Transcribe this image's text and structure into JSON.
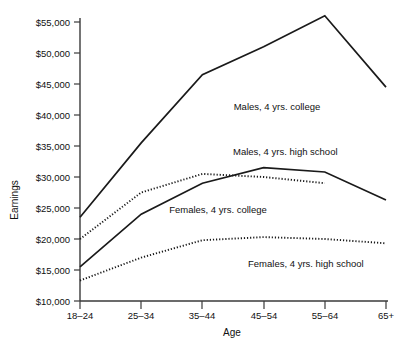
{
  "chart_data": {
    "type": "line",
    "title": "",
    "subtitle": "",
    "xlabel": "Age",
    "ylabel": "Earnings",
    "categories": [
      "18–24",
      "25–34",
      "35–44",
      "45–54",
      "55–64",
      "65+"
    ],
    "ytick_labels": [
      "$10,000",
      "$15,000",
      "$20,000",
      "$25,000",
      "$30,000",
      "$35,000",
      "$40,000",
      "$45,000",
      "$50,000",
      "$55,000"
    ],
    "ytick_values": [
      10000,
      15000,
      20000,
      25000,
      30000,
      35000,
      40000,
      45000,
      50000,
      55000
    ],
    "ylim": [
      10000,
      55000
    ],
    "grid": false,
    "legend_position": "inline-annotations",
    "series": [
      {
        "name": "Males, 4 yrs. college",
        "style": "solid",
        "color": "#1a1a1a",
        "values": [
          23500,
          35500,
          46500,
          51000,
          56000,
          44500
        ]
      },
      {
        "name": "Males, 4 yrs. high school",
        "style": "solid",
        "color": "#1a1a1a",
        "values": [
          15500,
          24000,
          29000,
          31500,
          30800,
          26300
        ]
      },
      {
        "name": "Females, 4 yrs. college",
        "style": "dotted",
        "color": "#1a1a1a",
        "values": [
          20000,
          27500,
          30500,
          30000,
          29000,
          null
        ]
      },
      {
        "name": "Females, 4 yrs. high school",
        "style": "dotted",
        "color": "#1a1a1a",
        "values": [
          13300,
          17000,
          19800,
          20300,
          20000,
          19300
        ]
      }
    ],
    "annotations": [
      {
        "text": "Males, 4 yrs. college",
        "x": 277,
        "y": 110
      },
      {
        "text": "Males, 4 yrs. high school",
        "x": 233,
        "y": 155
      },
      {
        "text": "Females, 4 yrs. college",
        "x": 218,
        "y": 213
      },
      {
        "text": "Females, 4 yrs. high school",
        "x": 248,
        "y": 267
      }
    ]
  },
  "axes": {
    "axis_color": "#3a3a3a",
    "line_color": "#1a1a1a"
  }
}
